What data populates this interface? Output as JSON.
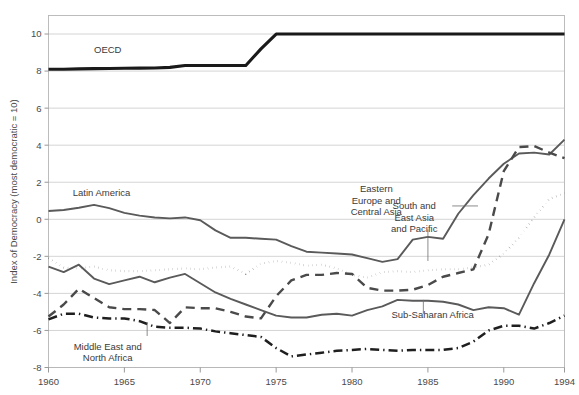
{
  "figure": {
    "background": "#ffffff",
    "frame_color": "#b5b5b5",
    "grid_color": "#c9c9c9"
  },
  "chart_data": {
    "type": "line",
    "title": "",
    "subtitle": "",
    "xlabel": "",
    "ylabel": "Index of Democracy (most democratic = 10)",
    "xlim": [
      1960,
      1994
    ],
    "ylim": [
      -8,
      11
    ],
    "grid": true,
    "legend_position": "inline-annotations",
    "xticks": [
      1960,
      1965,
      1970,
      1975,
      1980,
      1985,
      1990,
      1994
    ],
    "xtick_labels": [
      "1960",
      "1965",
      "1970",
      "1975",
      "1980",
      "1985",
      "1990",
      "1994"
    ],
    "yticks": [
      -8,
      -6,
      -4,
      -2,
      0,
      2,
      4,
      6,
      8,
      10
    ],
    "ytick_labels": [
      "-8",
      "-6",
      "-4",
      "-2",
      "0",
      "2",
      "4",
      "6",
      "8",
      "10"
    ],
    "x": [
      1960,
      1961,
      1962,
      1963,
      1964,
      1965,
      1966,
      1967,
      1968,
      1969,
      1970,
      1971,
      1972,
      1973,
      1974,
      1975,
      1976,
      1977,
      1978,
      1979,
      1980,
      1981,
      1982,
      1983,
      1984,
      1985,
      1986,
      1987,
      1988,
      1989,
      1990,
      1991,
      1992,
      1993,
      1994
    ],
    "series": [
      {
        "name": "OECD",
        "label": "OECD",
        "style": "solid",
        "color": "#1a1a1a",
        "width": 3.1,
        "label_x": 1963.0,
        "label_y": 8.95,
        "leader": null,
        "values": [
          8.1,
          8.1,
          8.12,
          8.13,
          8.14,
          8.15,
          8.16,
          8.17,
          8.2,
          8.3,
          8.3,
          8.3,
          8.3,
          8.3,
          9.2,
          10.0,
          10.0,
          10.0,
          10.0,
          10.0,
          10.0,
          10.0,
          10.0,
          10.0,
          10.0,
          10.0,
          10.0,
          10.0,
          10.0,
          10.0,
          10.0,
          10.0,
          10.0,
          10.0,
          10.0
        ]
      },
      {
        "name": "Latin America",
        "label": "Latin America",
        "style": "solid",
        "color": "#5a5a5a",
        "width": 1.9,
        "label_x": 1961.6,
        "label_y": 1.25,
        "leader": null,
        "values": [
          0.45,
          0.5,
          0.62,
          0.78,
          0.6,
          0.35,
          0.2,
          0.1,
          0.05,
          0.1,
          -0.05,
          -0.6,
          -1.0,
          -1.0,
          -1.05,
          -1.1,
          -1.45,
          -1.75,
          -1.8,
          -1.85,
          -1.9,
          -2.1,
          -2.3,
          -2.15,
          -1.1,
          -0.95,
          -1.05,
          0.3,
          1.3,
          2.2,
          3.0,
          3.55,
          3.6,
          3.5,
          4.3
        ]
      },
      {
        "name": "South and East Asia and Pacific",
        "label": "South and\nEast Asia\nand Pacific",
        "style": "dotted",
        "color": "#4f4f4f",
        "width": 2.1,
        "label_x": 1984.1,
        "label_y": 0.55,
        "leader": {
          "x": 1985.0,
          "y0": -0.55,
          "y1": -2.25
        },
        "values": [
          -2.1,
          -2.6,
          -2.65,
          -2.55,
          -2.75,
          -2.8,
          -2.8,
          -2.75,
          -2.7,
          -2.65,
          -2.7,
          -2.6,
          -2.55,
          -2.95,
          -2.4,
          -2.25,
          -2.35,
          -2.5,
          -2.45,
          -2.65,
          -3.0,
          -3.15,
          -2.85,
          -2.8,
          -2.85,
          -2.75,
          -2.7,
          -2.7,
          -2.6,
          -2.45,
          -1.85,
          -1.0,
          0.1,
          1.1,
          1.4
        ]
      },
      {
        "name": "Eastern Europe and Central Asia",
        "label": "Eastern\nEurope and\nCentral Asia",
        "style": "dashed",
        "color": "#4a4a4a",
        "width": 2.4,
        "label_x": 1981.6,
        "label_y": 1.45,
        "leader": {
          "x": 1986.6,
          "y0": 0.72,
          "y1": 0.72,
          "x1": 1988.3
        },
        "values": [
          -5.25,
          -4.6,
          -3.75,
          -4.25,
          -4.75,
          -4.85,
          -4.85,
          -4.9,
          -5.6,
          -4.75,
          -4.8,
          -4.8,
          -5.0,
          -5.25,
          -5.35,
          -4.15,
          -3.3,
          -3.0,
          -3.0,
          -2.9,
          -2.95,
          -3.7,
          -3.85,
          -3.85,
          -3.8,
          -3.55,
          -3.1,
          -2.9,
          -2.7,
          -0.8,
          2.6,
          3.9,
          3.95,
          3.6,
          3.3
        ]
      },
      {
        "name": "Sub-Saharan Africa",
        "label": "Sub-Saharan Africa",
        "style": "solid",
        "color": "#5a5a5a",
        "width": 1.9,
        "label_x": 1982.6,
        "label_y": -5.35,
        "leader": {
          "x": 1984.7,
          "y0": -5.1,
          "y1": -4.35
        },
        "values": [
          -2.55,
          -2.85,
          -2.45,
          -3.2,
          -3.5,
          -3.3,
          -3.1,
          -3.4,
          -3.15,
          -2.95,
          -3.45,
          -3.95,
          -4.3,
          -4.6,
          -4.9,
          -5.2,
          -5.3,
          -5.3,
          -5.15,
          -5.1,
          -5.2,
          -4.9,
          -4.7,
          -4.35,
          -4.4,
          -4.4,
          -4.45,
          -4.6,
          -4.9,
          -4.75,
          -4.8,
          -5.15,
          -3.45,
          -1.9,
          0.0
        ]
      },
      {
        "name": "Middle East and North Africa",
        "label": "Middle East and\nNorth Africa",
        "style": "dashdot",
        "color": "#1f1f1f",
        "width": 2.5,
        "label_x": 1963.9,
        "label_y": -7.05,
        "leader": {
          "x": 1966.5,
          "y0": -6.3,
          "y1": -5.55
        },
        "values": [
          -5.4,
          -5.1,
          -5.1,
          -5.3,
          -5.35,
          -5.35,
          -5.5,
          -5.8,
          -5.85,
          -5.85,
          -5.9,
          -6.05,
          -6.15,
          -6.25,
          -6.35,
          -6.95,
          -7.4,
          -7.3,
          -7.2,
          -7.1,
          -7.05,
          -7.0,
          -7.05,
          -7.1,
          -7.05,
          -7.05,
          -7.05,
          -6.95,
          -6.6,
          -6.0,
          -5.75,
          -5.75,
          -5.9,
          -5.6,
          -5.2
        ]
      }
    ]
  }
}
